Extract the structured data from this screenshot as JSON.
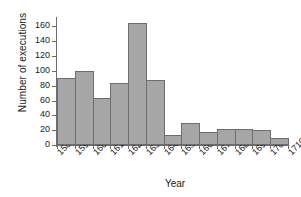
{
  "chart_data": {
    "type": "bar",
    "title": "",
    "xlabel": "Year",
    "ylabel": "Number of executions",
    "categories": [
      "1580",
      "1590",
      "1600",
      "1610",
      "1620",
      "1630",
      "1640",
      "1650",
      "1660",
      "1670",
      "1680",
      "1690",
      "1700"
    ],
    "bin_edges": [
      "1580",
      "1590",
      "1600",
      "1610",
      "1620",
      "1630",
      "1640",
      "1650",
      "1660",
      "1670",
      "1680",
      "1690",
      "1700",
      "1710"
    ],
    "values": [
      91,
      100,
      63,
      84,
      165,
      88,
      13,
      30,
      17,
      22,
      22,
      20,
      10
    ],
    "xtick_labels": [
      "1580",
      "1590",
      "1600",
      "1610",
      "1620",
      "1630",
      "1640",
      "1650",
      "1660",
      "1670",
      "1680",
      "1690",
      "1700",
      "1710"
    ],
    "ytick_labels": [
      "0",
      "20",
      "40",
      "60",
      "80",
      "100",
      "120",
      "140",
      "160"
    ],
    "ytick_values": [
      0,
      20,
      40,
      60,
      80,
      100,
      120,
      140,
      160
    ],
    "ylim": [
      0,
      170
    ],
    "xlim": [
      "1580",
      "1710"
    ],
    "grid": false,
    "legend": null,
    "bar_color": "#a6a6a6",
    "bar_edge_color": "#6d6d6d",
    "axis_color": "#6b6b6b",
    "background_color": "#ffffff",
    "text_color": "#1a1a1a"
  }
}
